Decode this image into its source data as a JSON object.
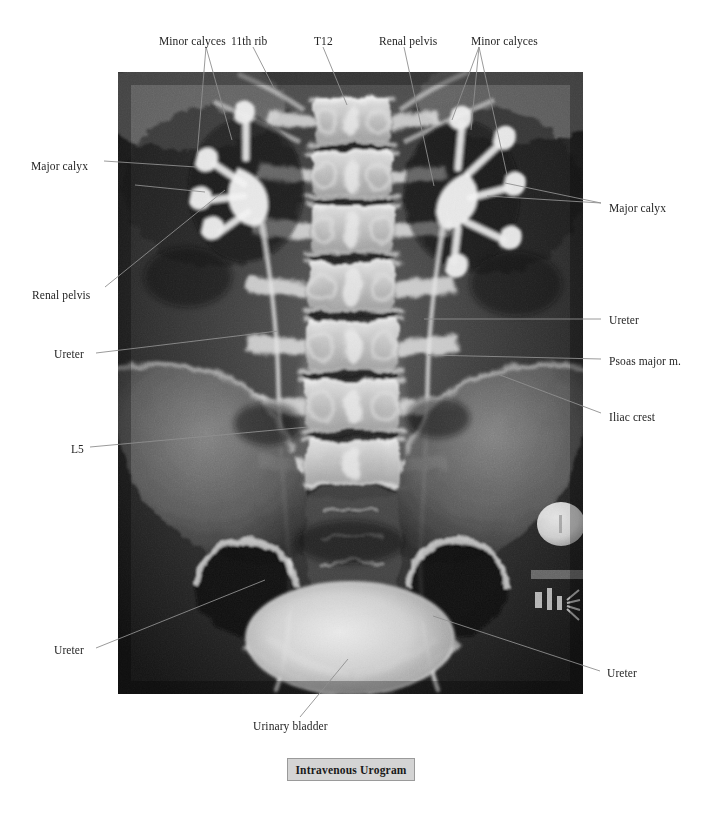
{
  "figure": {
    "title": "Intravenous Urogram",
    "modality": "radiograph",
    "caption_label": "Intravenous Urogram"
  },
  "plate": {
    "left": 118,
    "top": 72,
    "width": 465,
    "height": 622,
    "background_color": "#0a0a0a",
    "marker_note": "Urovision"
  },
  "colors": {
    "leader_line": "#8e8e8e",
    "label_text": "#252525",
    "caption_background": "#d4d4d4",
    "caption_border": "#9a9a9a",
    "page_background": "#ffffff"
  },
  "labels": [
    {
      "id": "minor-calyces-left",
      "text": "Minor calyces",
      "x": 159,
      "y": 36,
      "align": "left"
    },
    {
      "id": "eleventh-rib",
      "text": "11th rib",
      "x": 231,
      "y": 36,
      "align": "left"
    },
    {
      "id": "t12",
      "text": "T12",
      "x": 314,
      "y": 36,
      "align": "left"
    },
    {
      "id": "renal-pelvis-right",
      "text": "Renal pelvis",
      "x": 379,
      "y": 36,
      "align": "left"
    },
    {
      "id": "minor-calyces-right",
      "text": "Minor calyces",
      "x": 471,
      "y": 36,
      "align": "left"
    },
    {
      "id": "major-calyx-left",
      "text": "Major calyx",
      "x": 31,
      "y": 161,
      "align": "left"
    },
    {
      "id": "major-calyx-right",
      "text": "Major calyx",
      "x": 609,
      "y": 203,
      "align": "left"
    },
    {
      "id": "renal-pelvis-left",
      "text": "Renal pelvis",
      "x": 32,
      "y": 290,
      "align": "left"
    },
    {
      "id": "ureter-upper-right",
      "text": "Ureter",
      "x": 609,
      "y": 315,
      "align": "left"
    },
    {
      "id": "ureter-upper-left",
      "text": "Ureter",
      "x": 54,
      "y": 349,
      "align": "left"
    },
    {
      "id": "psoas-major",
      "text": "Psoas major m.",
      "x": 609,
      "y": 356,
      "align": "left"
    },
    {
      "id": "iliac-crest",
      "text": "Iliac crest",
      "x": 609,
      "y": 412,
      "align": "left"
    },
    {
      "id": "l5",
      "text": "L5",
      "x": 71,
      "y": 444,
      "align": "left"
    },
    {
      "id": "ureter-lower-left",
      "text": "Ureter",
      "x": 54,
      "y": 645,
      "align": "left"
    },
    {
      "id": "ureter-lower-right",
      "text": "Ureter",
      "x": 607,
      "y": 668,
      "align": "left"
    },
    {
      "id": "urinary-bladder",
      "text": "Urinary bladder",
      "x": 253,
      "y": 721,
      "align": "left"
    }
  ],
  "leaders": [
    {
      "id": "leader-minor-calyces-left",
      "for": "minor-calyces-left",
      "points": "206,47 232,140"
    },
    {
      "id": "leader-minor-calyces-left-2",
      "for": "minor-calyces-left",
      "points": "206,47 197,156"
    },
    {
      "id": "leader-eleventh-rib",
      "for": "eleventh-rib",
      "points": "253,47 275,90"
    },
    {
      "id": "leader-t12",
      "for": "t12",
      "points": "323,47 347,105"
    },
    {
      "id": "leader-renal-pelvis-right",
      "for": "renal-pelvis-right",
      "points": "404,47 434,186"
    },
    {
      "id": "leader-minor-calyces-r1",
      "for": "minor-calyces-right",
      "points": "479,47 452,120"
    },
    {
      "id": "leader-minor-calyces-r2",
      "for": "minor-calyces-right",
      "points": "479,47 471,130"
    },
    {
      "id": "leader-minor-calyces-r3",
      "for": "minor-calyces-right",
      "points": "479,47 507,175"
    },
    {
      "id": "leader-major-calyx-left",
      "for": "major-calyx-left",
      "points": "104,161 196,167"
    },
    {
      "id": "leader-major-calyx-left-2",
      "for": "major-calyx-left",
      "points": "135,185 205,192"
    },
    {
      "id": "leader-major-calyx-right",
      "for": "major-calyx-right",
      "points": "601,203 505,183"
    },
    {
      "id": "leader-major-calyx-right-2",
      "for": "major-calyx-right",
      "points": "601,203 487,196"
    },
    {
      "id": "leader-renal-pelvis-left",
      "for": "renal-pelvis-left",
      "points": "105,287 225,190"
    },
    {
      "id": "leader-ureter-upper-right",
      "for": "ureter-upper-right",
      "points": "601,319 424,319"
    },
    {
      "id": "leader-ureter-upper-left",
      "for": "ureter-upper-left",
      "points": "96,353 278,331"
    },
    {
      "id": "leader-psoas-major",
      "for": "psoas-major",
      "points": "601,359 428,355"
    },
    {
      "id": "leader-iliac-crest",
      "for": "iliac-crest",
      "points": "601,413 492,372"
    },
    {
      "id": "leader-l5",
      "for": "l5",
      "points": "90,447 308,427"
    },
    {
      "id": "leader-ureter-lower-left",
      "for": "ureter-lower-left",
      "points": "96,648 265,580"
    },
    {
      "id": "leader-ureter-lower-right",
      "for": "ureter-lower-right",
      "points": "600,671 433,616"
    },
    {
      "id": "leader-urinary-bladder",
      "for": "urinary-bladder",
      "points": "300,717 348,659"
    }
  ]
}
